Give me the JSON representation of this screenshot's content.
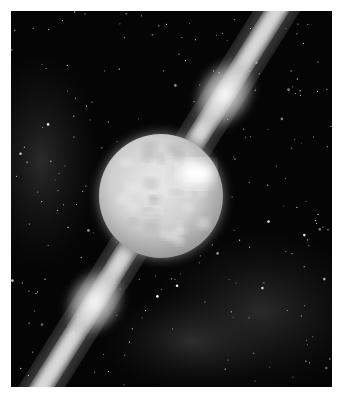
{
  "image": {
    "description": "Artist illustration of a glowing star (neutron star / magnetar) emitting two bright polar jets into a starfield",
    "colors": {
      "background": "#ffffff",
      "space": "#050505",
      "star_body": "#d8d8d8",
      "star_halo": "#7a7a7a",
      "jet": "#f4f4f4",
      "nebula": "#3a3a3a"
    }
  }
}
